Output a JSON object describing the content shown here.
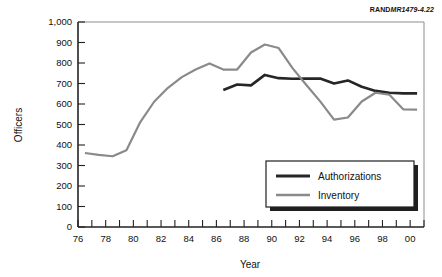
{
  "source_credit": {
    "rand": "RAND",
    "doc_id": "MR1479-4.22"
  },
  "chart_data": {
    "type": "line",
    "title": "",
    "xlabel": "Year",
    "ylabel": "Officers",
    "xlim": [
      76,
      101
    ],
    "ylim": [
      0,
      1000
    ],
    "grid": false,
    "legend_position": "bottom-right",
    "x_tick_labels": [
      "76",
      "78",
      "80",
      "82",
      "84",
      "86",
      "88",
      "90",
      "92",
      "94",
      "96",
      "98",
      "00"
    ],
    "x_tick_values": [
      76,
      78,
      80,
      82,
      84,
      86,
      88,
      90,
      92,
      94,
      96,
      98,
      100
    ],
    "x_minor_tick_values": [
      77,
      79,
      81,
      83,
      85,
      87,
      89,
      91,
      93,
      95,
      97,
      99,
      101
    ],
    "y_tick_labels": [
      "0",
      "100",
      "200",
      "300",
      "400",
      "500",
      "600",
      "700",
      "800",
      "900",
      "1,000"
    ],
    "y_tick_values": [
      0,
      100,
      200,
      300,
      400,
      500,
      600,
      700,
      800,
      900,
      1000
    ],
    "colors": {
      "authorizations": "#262626",
      "inventory": "#8a8a8a"
    },
    "series": [
      {
        "name": "Authorizations",
        "color": "#262626",
        "x": [
          86.5,
          87.5,
          88.5,
          89.5,
          90.5,
          91.5,
          92.5,
          93.5,
          94.5,
          95.5,
          96.5,
          97.5,
          98.5,
          99.5,
          100.5
        ],
        "values": [
          668,
          695,
          691,
          742,
          726,
          723,
          724,
          724,
          700,
          715,
          684,
          664,
          655,
          652,
          652
        ]
      },
      {
        "name": "Inventory",
        "color": "#8a8a8a",
        "x": [
          76.5,
          77.5,
          78.5,
          79.5,
          80.5,
          81.5,
          82.5,
          83.5,
          84.5,
          85.5,
          86.5,
          87.5,
          88.5,
          89.5,
          90.5,
          91.5,
          92.5,
          93.5,
          94.5,
          95.5,
          96.5,
          97.5,
          98.5,
          99.5,
          100.5
        ],
        "values": [
          361,
          352,
          345,
          374,
          512,
          611,
          679,
          731,
          768,
          798,
          768,
          768,
          851,
          890,
          873,
          775,
          693,
          613,
          524,
          534,
          612,
          655,
          645,
          574,
          573
        ]
      }
    ]
  },
  "legend": {
    "items": [
      {
        "label": "Authorizations",
        "color": "#262626"
      },
      {
        "label": "Inventory",
        "color": "#8a8a8a"
      }
    ]
  }
}
